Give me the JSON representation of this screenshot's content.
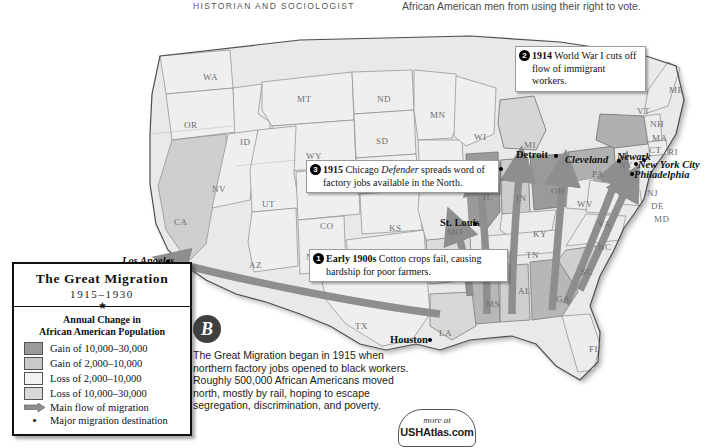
{
  "header": {
    "left_caption": "HISTORIAN AND SOCIOLOGIST",
    "right_caption": "African American men from using their right to vote."
  },
  "legend": {
    "title": "The Great Migration",
    "years": "1915–1930",
    "star": "★",
    "subtitle_line1": "Annual Change in",
    "subtitle_line2": "African American Population",
    "items": [
      {
        "label": "Gain of 10,000–30,000",
        "swatch": "#9a9a9a",
        "type": "swatch"
      },
      {
        "label": "Gain of 2,000–10,000",
        "swatch": "#c9c9c9",
        "type": "swatch"
      },
      {
        "label": "Loss of 2,000–10,000",
        "swatch": "#f2f2f2",
        "type": "swatch"
      },
      {
        "label": "Loss of 10,000–30,000",
        "swatch": "#d8d8d8",
        "type": "swatch"
      },
      {
        "label": "Main flow of migration",
        "swatch": "#8e8e8e",
        "type": "arrow"
      },
      {
        "label": "Major migration destination",
        "swatch": "#000000",
        "type": "dot"
      }
    ]
  },
  "callouts": [
    {
      "number": "1",
      "bold": "Early 1900s",
      "text": " Cotton crops fail, causing hardship for poor farmers.",
      "full": "Early 1900s Cotton crops fail, causing hardship for poor farmers."
    },
    {
      "number": "2",
      "bold": "1914",
      "text": " World War I cuts off flow of immigrant workers.",
      "full": "1914 World War I cuts off flow of immigrant workers."
    },
    {
      "number": "3",
      "bold": "1915",
      "italic": "Defender",
      "text": " Chicago Defender spreads word of factory jobs available in the North.",
      "full": "1915 Chicago Defender spreads word of factory jobs available in the North."
    }
  ],
  "sidebar_note": {
    "marker": "B",
    "text": "The Great Migration began in 1915 when northern factory jobs opened to black workers. Roughly 500,000 African Americans moved north, mostly by rail, hoping to escape segregation, discrimination, and poverty."
  },
  "badge": {
    "line1": "more at",
    "line2": "USHAtlas.com"
  },
  "cities": [
    {
      "name": "Los Angeles",
      "x": 122,
      "y": 241,
      "dx": 44,
      "dy": 5,
      "slant": true
    },
    {
      "name": "Houston",
      "x": 390,
      "y": 320,
      "dx": 38,
      "dy": 4,
      "slant": false
    },
    {
      "name": "St. Louis",
      "x": 440,
      "y": 203,
      "dx": 33,
      "dy": 5,
      "slant": false
    },
    {
      "name": "Chicago",
      "x": 455,
      "y": 148,
      "dx": 44,
      "dy": 5,
      "slant": false
    },
    {
      "name": "Detroit",
      "x": 516,
      "y": 135,
      "dx": 38,
      "dy": 5,
      "slant": false
    },
    {
      "name": "Cleveland",
      "x": 565,
      "y": 140,
      "dx": 52,
      "dy": 5,
      "slant": true
    },
    {
      "name": "Newark",
      "x": 617,
      "y": 137,
      "dx": 25,
      "dy": 7,
      "slant": true
    },
    {
      "name": "New York City",
      "x": 638,
      "y": 145,
      "dx": -4,
      "dy": 3,
      "slant": true
    },
    {
      "name": "Philadelphia",
      "x": 634,
      "y": 155,
      "dx": -4,
      "dy": 3,
      "slant": true
    }
  ],
  "states": [
    {
      "ab": "WA",
      "x": 203,
      "y": 58
    },
    {
      "ab": "OR",
      "x": 184,
      "y": 106
    },
    {
      "ab": "ID",
      "x": 240,
      "y": 123
    },
    {
      "ab": "MT",
      "x": 297,
      "y": 80
    },
    {
      "ab": "ND",
      "x": 377,
      "y": 80
    },
    {
      "ab": "SD",
      "x": 376,
      "y": 122
    },
    {
      "ab": "NE",
      "x": 382,
      "y": 157
    },
    {
      "ab": "WY",
      "x": 306,
      "y": 137
    },
    {
      "ab": "NV",
      "x": 212,
      "y": 170
    },
    {
      "ab": "UT",
      "x": 262,
      "y": 185
    },
    {
      "ab": "CA",
      "x": 174,
      "y": 203
    },
    {
      "ab": "AZ",
      "x": 249,
      "y": 246
    },
    {
      "ab": "CO",
      "x": 320,
      "y": 207
    },
    {
      "ab": "NM",
      "x": 306,
      "y": 238
    },
    {
      "ab": "KS",
      "x": 389,
      "y": 209
    },
    {
      "ab": "OK",
      "x": 405,
      "y": 237
    },
    {
      "ab": "TX",
      "x": 355,
      "y": 307
    },
    {
      "ab": "MN",
      "x": 430,
      "y": 96
    },
    {
      "ab": "IA",
      "x": 437,
      "y": 153
    },
    {
      "ab": "MO",
      "x": 447,
      "y": 213
    },
    {
      "ab": "AR",
      "x": 456,
      "y": 240
    },
    {
      "ab": "LA",
      "x": 439,
      "y": 314
    },
    {
      "ab": "WI",
      "x": 474,
      "y": 118
    },
    {
      "ab": "IL",
      "x": 483,
      "y": 178
    },
    {
      "ab": "MS",
      "x": 486,
      "y": 285
    },
    {
      "ab": "MI",
      "x": 524,
      "y": 126
    },
    {
      "ab": "IN",
      "x": 516,
      "y": 179
    },
    {
      "ab": "OH",
      "x": 551,
      "y": 172
    },
    {
      "ab": "KY",
      "x": 533,
      "y": 215
    },
    {
      "ab": "TN",
      "x": 526,
      "y": 236
    },
    {
      "ab": "AL",
      "x": 518,
      "y": 272
    },
    {
      "ab": "GA",
      "x": 556,
      "y": 280
    },
    {
      "ab": "FL",
      "x": 589,
      "y": 330
    },
    {
      "ab": "SC",
      "x": 581,
      "y": 253
    },
    {
      "ab": "NC",
      "x": 598,
      "y": 228
    },
    {
      "ab": "VA",
      "x": 598,
      "y": 205
    },
    {
      "ab": "WV",
      "x": 577,
      "y": 185
    },
    {
      "ab": "PA",
      "x": 592,
      "y": 155
    },
    {
      "ab": "NY",
      "x": 619,
      "y": 146
    },
    {
      "ab": "ME",
      "x": 669,
      "y": 71
    },
    {
      "ab": "VT",
      "x": 637,
      "y": 92
    },
    {
      "ab": "NH",
      "x": 650,
      "y": 105
    },
    {
      "ab": "MA",
      "x": 652,
      "y": 119
    },
    {
      "ab": "CT",
      "x": 649,
      "y": 131
    },
    {
      "ab": "RI",
      "x": 668,
      "y": 133
    },
    {
      "ab": "NJ",
      "x": 647,
      "y": 174
    },
    {
      "ab": "DE",
      "x": 651,
      "y": 187
    },
    {
      "ab": "MD",
      "x": 654,
      "y": 200
    }
  ],
  "colors": {
    "gain_high": "#9a9a9a",
    "gain_low": "#c9c9c9",
    "loss_low": "#f2f2f2",
    "loss_high": "#d8d8d8",
    "arrow": "#8e8e8e",
    "outline": "#4d4d4d",
    "page_bg": "#ffffff"
  }
}
